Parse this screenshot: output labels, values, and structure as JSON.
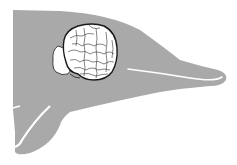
{
  "figure": {
    "subject": "Dolphin head silhouette with brain illustration",
    "colors": {
      "background": "#ffffff",
      "silhouette": "#a9a9a9",
      "brain_fill": "#ffffff",
      "brain_outline": "#1a1a1a",
      "highlight_line": "#ffffff"
    }
  }
}
